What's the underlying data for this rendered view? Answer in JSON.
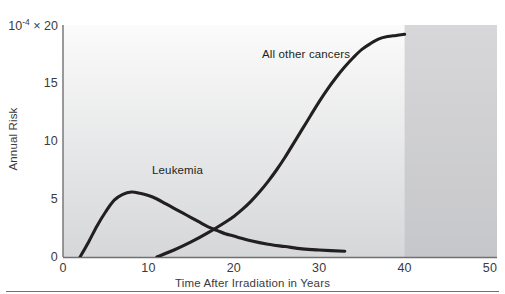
{
  "chart_data": {
    "type": "line",
    "title": "",
    "xlabel": "Time After Irradiation in Years",
    "ylabel": "Annual Risk",
    "y_multiplier_label": "10⁻⁴ × 20",
    "y_multiplier_base": "10",
    "y_multiplier_exp": "-4",
    "y_multiplier_times": "×",
    "xlim": [
      0,
      50
    ],
    "ylim": [
      0,
      20
    ],
    "xticks": [
      0,
      10,
      20,
      30,
      40,
      50
    ],
    "xtick_labels": [
      "0",
      "10",
      "20",
      "30",
      "40",
      "50"
    ],
    "yticks": [
      0,
      5,
      10,
      15,
      20
    ],
    "ytick_labels": [
      "0",
      "5",
      "10",
      "15",
      "20"
    ],
    "grid": false,
    "legend": "inline-annotations",
    "shaded_region": {
      "label": "projected",
      "x_start": 40,
      "x_end": 50,
      "color": "#bdbec0"
    },
    "background_gradient": {
      "top": "#fbfbfb",
      "bottom": "#d6d7d9"
    },
    "line_color": "#231f20",
    "series": [
      {
        "name": "Leukemia",
        "label_position": {
          "x": 10.5,
          "y": 7.9
        },
        "x": [
          2.0,
          3.0,
          4.0,
          5.0,
          6.0,
          7.0,
          8.0,
          9.0,
          10.0,
          11.0,
          12.0,
          13.0,
          14.0,
          15.0,
          16.0,
          17.0,
          18.0,
          19.0,
          20.0,
          22.0,
          24.0,
          26.0,
          28.0,
          30.0,
          33.0
        ],
        "y": [
          0.0,
          1.3,
          2.7,
          3.9,
          4.9,
          5.4,
          5.6,
          5.5,
          5.3,
          5.0,
          4.6,
          4.2,
          3.8,
          3.4,
          3.0,
          2.6,
          2.3,
          2.0,
          1.8,
          1.4,
          1.1,
          0.9,
          0.7,
          0.6,
          0.5
        ]
      },
      {
        "name": "All other cancers",
        "label_position": {
          "x": 23.5,
          "y": 16.6
        },
        "x": [
          11.0,
          13.0,
          15.0,
          17.0,
          19.0,
          20.0,
          21.0,
          22.0,
          23.0,
          24.0,
          25.0,
          26.0,
          27.0,
          28.0,
          29.0,
          30.0,
          31.0,
          32.0,
          33.0,
          34.0,
          35.0,
          36.0,
          37.0,
          38.0,
          39.0,
          40.0
        ],
        "y": [
          0.0,
          0.6,
          1.3,
          2.1,
          3.0,
          3.5,
          4.1,
          4.8,
          5.6,
          6.5,
          7.5,
          8.6,
          9.8,
          11.0,
          12.2,
          13.4,
          14.5,
          15.5,
          16.4,
          17.2,
          17.9,
          18.4,
          18.8,
          19.0,
          19.1,
          19.2
        ]
      }
    ]
  }
}
